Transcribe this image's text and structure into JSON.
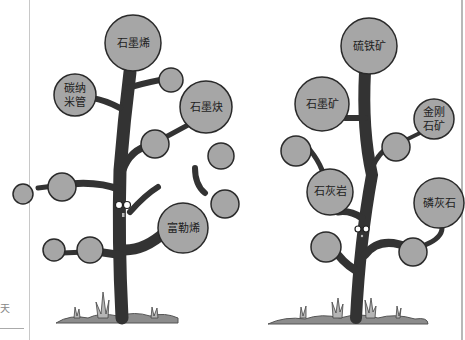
{
  "margin": {
    "partial_char": "天"
  },
  "colors": {
    "leaf_fill": "#a6a6a6",
    "outline": "#2a2a2a",
    "trunk": "#333333",
    "ground": "#8c8c8c",
    "grass": "#b0b0b0"
  },
  "left_tree": {
    "title": "carbon allotropes tree",
    "leaves": [
      {
        "id": "top",
        "label": "石墨烯"
      },
      {
        "id": "left_upper",
        "label_line1": "碳纳",
        "label_line2": "米管"
      },
      {
        "id": "right_upper",
        "label": "石墨炔"
      },
      {
        "id": "right_lower",
        "label": "富勒烯"
      },
      {
        "id": "blank_1",
        "label": ""
      },
      {
        "id": "blank_2",
        "label": ""
      },
      {
        "id": "blank_3",
        "label": ""
      },
      {
        "id": "blank_4",
        "label": ""
      },
      {
        "id": "blank_5",
        "label": ""
      },
      {
        "id": "blank_6",
        "label": ""
      },
      {
        "id": "blank_7",
        "label": ""
      },
      {
        "id": "blank_8",
        "label": ""
      }
    ]
  },
  "right_tree": {
    "title": "minerals tree",
    "leaves": [
      {
        "id": "top",
        "label": "硫铁矿"
      },
      {
        "id": "left_upper",
        "label": "石墨矿"
      },
      {
        "id": "right_upper",
        "label_line1": "金刚",
        "label_line2": "石矿"
      },
      {
        "id": "left_lower",
        "label": "石灰岩"
      },
      {
        "id": "right_lower",
        "label": "磷灰石"
      },
      {
        "id": "blank_1",
        "label": ""
      },
      {
        "id": "blank_2",
        "label": ""
      },
      {
        "id": "blank_3",
        "label": ""
      },
      {
        "id": "blank_4",
        "label": ""
      }
    ]
  }
}
